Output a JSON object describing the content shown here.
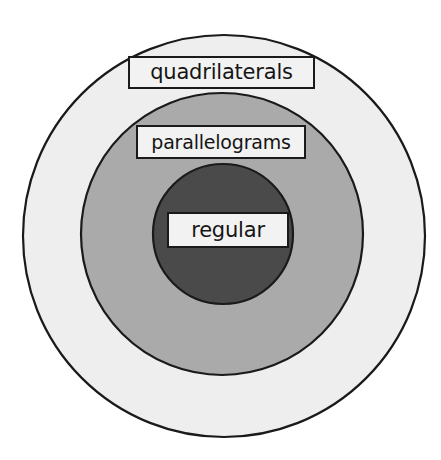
{
  "diagram": {
    "type": "nested-set-venn",
    "background_color": "#ffffff",
    "rings": [
      {
        "id": "outer",
        "name": "quadrilaterals",
        "label": "quadrilaterals",
        "fill_color": "#eeeeee",
        "stroke_color": "#1a1a1a",
        "center_x": 224,
        "center_y": 236,
        "radius": 202
      },
      {
        "id": "middle",
        "name": "parallelograms",
        "label": "parallelograms",
        "fill_color": "#aaaaaa",
        "stroke_color": "#1a1a1a",
        "center_x": 222,
        "center_y": 234,
        "radius": 142
      },
      {
        "id": "inner",
        "name": "regular",
        "label": "regular",
        "fill_color": "#4a4a4a",
        "stroke_color": "#1a1a1a",
        "center_x": 223,
        "center_y": 234,
        "radius": 71
      }
    ],
    "labels": {
      "outer": "quadrilaterals",
      "middle": "parallelograms",
      "inner": "regular"
    },
    "label_box_style": {
      "fill_color": "#f2f2f2",
      "border_color": "#1a1a1a",
      "text_color": "#151515"
    }
  }
}
